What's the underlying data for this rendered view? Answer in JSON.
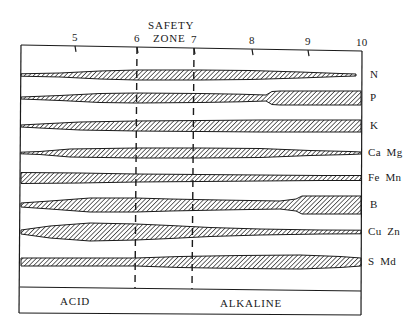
{
  "diagram": {
    "zone_label_line1": "SAFETY",
    "zone_label_line2": "ZONE",
    "regions": {
      "acid": "ACID",
      "alkaline": "ALKALINE"
    },
    "ph_ticks": [
      {
        "label": "5",
        "x": 75
      },
      {
        "label": "6",
        "x": 137
      },
      {
        "label": "7",
        "x": 194
      },
      {
        "label": "8",
        "x": 252
      },
      {
        "label": "9",
        "x": 308
      },
      {
        "label": "10",
        "x": 362
      }
    ],
    "safety_zone": {
      "from_ph": "6",
      "to_ph": "7"
    },
    "nutrients": [
      {
        "label": "N",
        "cy": 75,
        "profile": [
          [
            21,
            1.2
          ],
          [
            60,
            2
          ],
          [
            100,
            4
          ],
          [
            136,
            5
          ],
          [
            200,
            5
          ],
          [
            250,
            4.5
          ],
          [
            300,
            3
          ],
          [
            340,
            1.5
          ],
          [
            356,
            1
          ]
        ]
      },
      {
        "label": "P",
        "cy": 98,
        "profile": [
          [
            21,
            1
          ],
          [
            60,
            2.5
          ],
          [
            100,
            4.5
          ],
          [
            136,
            5
          ],
          [
            200,
            4.5
          ],
          [
            240,
            3.8
          ],
          [
            266,
            3
          ],
          [
            272,
            6.5
          ],
          [
            280,
            7
          ],
          [
            361,
            7
          ]
        ]
      },
      {
        "label": "K",
        "cy": 126,
        "profile": [
          [
            21,
            1
          ],
          [
            40,
            2
          ],
          [
            80,
            4
          ],
          [
            136,
            5
          ],
          [
            200,
            5.5
          ],
          [
            260,
            6
          ],
          [
            361,
            6
          ]
        ]
      },
      {
        "label": "Ca Mg",
        "cy": 153,
        "profile": [
          [
            21,
            0.8
          ],
          [
            40,
            1.5
          ],
          [
            70,
            4
          ],
          [
            136,
            5
          ],
          [
            200,
            5
          ],
          [
            260,
            4.5
          ],
          [
            310,
            2.5
          ],
          [
            350,
            1.5
          ],
          [
            361,
            1
          ]
        ]
      },
      {
        "label": "Fe Mn",
        "cy": 178,
        "profile": [
          [
            21,
            5.5
          ],
          [
            80,
            5
          ],
          [
            136,
            4
          ],
          [
            200,
            3.5
          ],
          [
            260,
            3
          ],
          [
            320,
            2.5
          ],
          [
            361,
            2.5
          ]
        ]
      },
      {
        "label": "B",
        "cy": 205,
        "profile": [
          [
            21,
            2
          ],
          [
            50,
            4
          ],
          [
            90,
            7
          ],
          [
            136,
            7
          ],
          [
            170,
            6
          ],
          [
            220,
            5
          ],
          [
            280,
            4
          ],
          [
            296,
            6
          ],
          [
            302,
            9
          ],
          [
            361,
            9
          ]
        ]
      },
      {
        "label": "Cu Zn",
        "cy": 232,
        "profile": [
          [
            21,
            2
          ],
          [
            50,
            6
          ],
          [
            90,
            9
          ],
          [
            136,
            8
          ],
          [
            170,
            6.5
          ],
          [
            210,
            4.5
          ],
          [
            260,
            3
          ],
          [
            320,
            2
          ],
          [
            361,
            1.8
          ]
        ]
      },
      {
        "label": "S Md",
        "cy": 262,
        "profile": [
          [
            21,
            4
          ],
          [
            80,
            4
          ],
          [
            136,
            4
          ],
          [
            180,
            5.5
          ],
          [
            240,
            6.5
          ],
          [
            300,
            7
          ],
          [
            340,
            5.5
          ],
          [
            361,
            4
          ]
        ]
      }
    ]
  }
}
